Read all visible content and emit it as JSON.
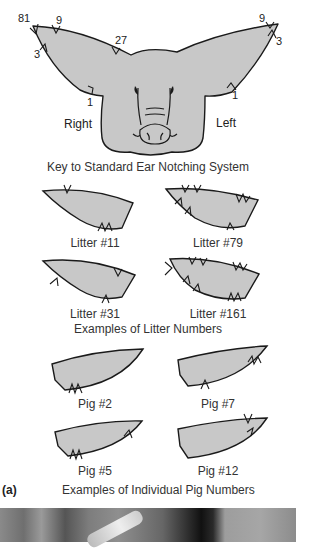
{
  "figure": {
    "panel_label": "(a)",
    "colors": {
      "ear_fill": "#c8c8c8",
      "outline": "#1a1a1a",
      "background": "#ffffff"
    },
    "key": {
      "caption": "Key to Standard Ear Notching System",
      "side_labels": {
        "right": "Right",
        "left": "Left"
      },
      "right_ear_values": [
        "81",
        "9",
        "27",
        "3",
        "1"
      ],
      "left_ear_values": [
        "9",
        "3",
        "1"
      ]
    },
    "litter_examples": {
      "caption": "Examples of Litter Numbers",
      "items": [
        {
          "label": "Litter #11"
        },
        {
          "label": "Litter #79"
        },
        {
          "label": "Litter #31"
        },
        {
          "label": "Litter #161"
        }
      ]
    },
    "pig_examples": {
      "caption": "Examples of Individual Pig Numbers",
      "items": [
        {
          "label": "Pig #2"
        },
        {
          "label": "Pig #7"
        },
        {
          "label": "Pig #5"
        },
        {
          "label": "Pig #12"
        }
      ]
    }
  }
}
